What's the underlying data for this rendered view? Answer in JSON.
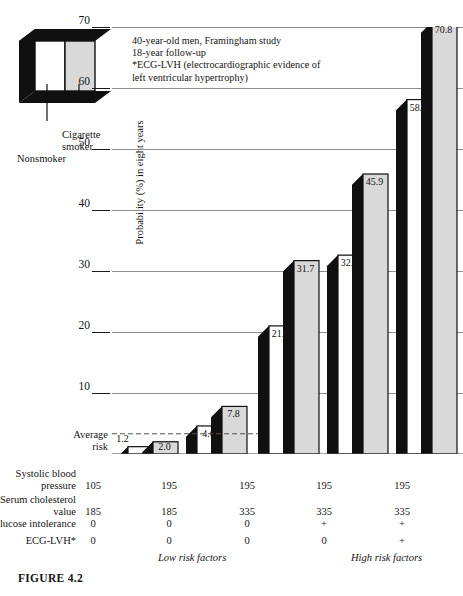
{
  "figure": {
    "caption": "FIGURE 4.2"
  },
  "legend": {
    "nonsmoker_label": "Nonsmoker",
    "cigarette_label_line1": "Cigarette",
    "cigarette_label_line2": "smoker",
    "nonsmoker_color": "#ffffff",
    "smoker_color": "#d9d9d9",
    "shadow_color": "#101010"
  },
  "annotation": {
    "line1": "40-year-old men, Framingham study",
    "line2": "18-year follow-up",
    "line3": "*ECG-LVH (electrocardiographic evidence of",
    "line4": "left ventricular hypertrophy)"
  },
  "average_risk": {
    "line1": "Average",
    "line2": "risk",
    "value": 2.0
  },
  "axis": {
    "ylabel": "Probability (%) in eight years",
    "yticks": [
      70,
      60,
      50,
      40,
      30,
      20,
      10
    ],
    "ymin": 0,
    "ymax": 70
  },
  "table": {
    "rows": [
      {
        "label_line1": "Systolic blood",
        "label_line2": "pressure",
        "values": [
          "105",
          "195",
          "195",
          "195",
          "195"
        ]
      },
      {
        "label_line1": "Serum cholesterol",
        "label_line2": "value",
        "values": [
          "185",
          "185",
          "335",
          "335",
          "335"
        ]
      },
      {
        "label_line1": "Glucose intolerance",
        "label_line2": "",
        "values": [
          "0",
          "0",
          "0",
          "+",
          "+"
        ]
      },
      {
        "label_line1": "ECG-LVH*",
        "label_line2": "",
        "values": [
          "0",
          "0",
          "0",
          "0",
          "+"
        ]
      }
    ],
    "risk_low": "Low risk factors",
    "risk_high": "High risk factors"
  },
  "chart_data": {
    "type": "bar",
    "title": "",
    "xlabel": "",
    "ylabel": "Probability (%) in eight years",
    "ylim": [
      0,
      70
    ],
    "yticks": [
      10,
      20,
      30,
      40,
      50,
      60,
      70
    ],
    "grid": true,
    "legend_position": "top-left",
    "categories": [
      "1",
      "2",
      "3",
      "4",
      "5"
    ],
    "series": [
      {
        "name": "Nonsmoker",
        "values": [
          1.2,
          4.6,
          21.0,
          32.6,
          58.1
        ]
      },
      {
        "name": "Cigarette smoker",
        "values": [
          2.0,
          7.8,
          31.7,
          45.9,
          70.8
        ]
      }
    ],
    "annotations": {
      "average_risk_line": 2.0,
      "note": "40-year-old men, Framingham study; 18-year follow-up; *ECG-LVH (electrocardiographic evidence of left ventricular hypertrophy)"
    },
    "risk_factors": {
      "Systolic blood pressure": [
        "105",
        "195",
        "195",
        "195",
        "195"
      ],
      "Serum cholesterol value": [
        "185",
        "185",
        "335",
        "335",
        "335"
      ],
      "Glucose intolerance": [
        "0",
        "0",
        "0",
        "+",
        "+"
      ],
      "ECG-LVH*": [
        "0",
        "0",
        "0",
        "0",
        "+"
      ]
    }
  }
}
